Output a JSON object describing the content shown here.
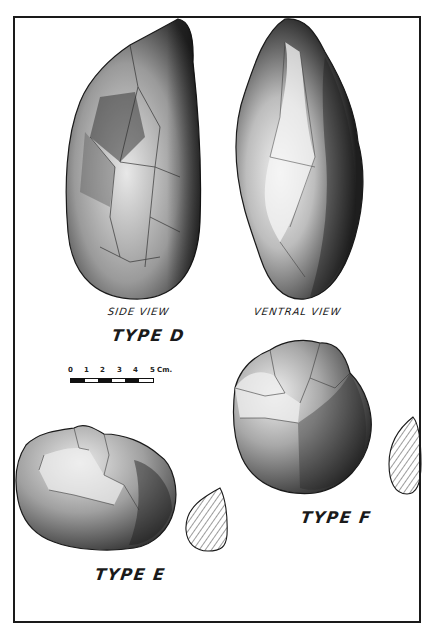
{
  "figure": {
    "labels": {
      "side_view": "SIDE VIEW",
      "ventral_view": "VENTRAL VIEW",
      "type_d": "TYPE D",
      "type_e": "TYPE E",
      "type_f": "TYPE F"
    },
    "scale_bar": {
      "ticks": [
        "0",
        "1",
        "2",
        "3",
        "4",
        "5"
      ],
      "unit": "Cm.",
      "segments": [
        "black",
        "white",
        "black",
        "white",
        "black",
        "white"
      ]
    },
    "colors": {
      "ink": "#1a1a1a",
      "paper": "#ffffff",
      "stone_dark": "#2e2e2e",
      "stone_mid": "#7a7a7a",
      "stone_light": "#d9d9d9"
    }
  }
}
